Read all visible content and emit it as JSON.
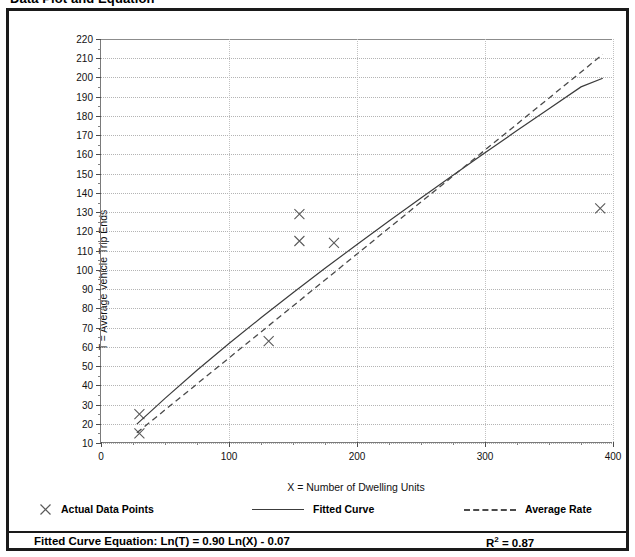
{
  "title": "Data Plot and Equation",
  "chart_data": {
    "type": "scatter",
    "title": "Data Plot and Equation",
    "xlabel": "X = Number of Dwelling Units",
    "ylabel": "T = Average Vehicle Trip Ends",
    "xlim": [
      0,
      400
    ],
    "ylim": [
      10,
      220
    ],
    "xticks": [
      0,
      100,
      200,
      300,
      400
    ],
    "xtick_labels": [
      "0",
      "100",
      "200",
      "300",
      "400"
    ],
    "x_minor_step": 25,
    "yticks": [
      10,
      20,
      30,
      40,
      50,
      60,
      70,
      80,
      90,
      100,
      110,
      120,
      130,
      140,
      150,
      160,
      170,
      180,
      190,
      200,
      210,
      220
    ],
    "ytick_labels": [
      "10",
      "20",
      "30",
      "40",
      "50",
      "60",
      "70",
      "80",
      "90",
      "100",
      "110",
      "120",
      "130",
      "140",
      "150",
      "160",
      "170",
      "180",
      "190",
      "200",
      "210",
      "220"
    ],
    "grid": true,
    "legend_position": "bottom",
    "series": [
      {
        "name": "Actual Data Points",
        "type": "scatter",
        "marker": "x",
        "color": "#5a5a5a",
        "points": [
          {
            "x": 30,
            "y": 25
          },
          {
            "x": 30,
            "y": 15
          },
          {
            "x": 131,
            "y": 63
          },
          {
            "x": 155,
            "y": 129
          },
          {
            "x": 155,
            "y": 115
          },
          {
            "x": 182,
            "y": 114
          },
          {
            "x": 390,
            "y": 132
          }
        ]
      },
      {
        "name": "Fitted Curve",
        "type": "line",
        "style": "solid",
        "color": "#3c3c3c",
        "equation": "Ln(T) = 0.90 Ln(X) - 0.07",
        "points": [
          {
            "x": 28,
            "y": 19.8
          },
          {
            "x": 50,
            "y": 33.2
          },
          {
            "x": 75,
            "y": 47.8
          },
          {
            "x": 100,
            "y": 61.7
          },
          {
            "x": 125,
            "y": 75.1
          },
          {
            "x": 150,
            "y": 88.1
          },
          {
            "x": 175,
            "y": 100.8
          },
          {
            "x": 200,
            "y": 113.2
          },
          {
            "x": 225,
            "y": 125.4
          },
          {
            "x": 250,
            "y": 137.4
          },
          {
            "x": 275,
            "y": 149.2
          },
          {
            "x": 300,
            "y": 160.9
          },
          {
            "x": 325,
            "y": 172.4
          },
          {
            "x": 350,
            "y": 183.8
          },
          {
            "x": 375,
            "y": 195.1
          },
          {
            "x": 392,
            "y": 199.6
          }
        ]
      },
      {
        "name": "Average Rate",
        "type": "line",
        "style": "dashed",
        "color": "#4a4a4a",
        "points": [
          {
            "x": 28,
            "y": 15.3
          },
          {
            "x": 392,
            "y": 212.0
          }
        ]
      }
    ],
    "annotations": [
      {
        "label": "Fitted Curve Equation:  Ln(T) = 0.90 Ln(X) - 0.07"
      },
      {
        "label": "R2 = 0.87"
      }
    ]
  },
  "legend": {
    "points_label": "Actual Data Points",
    "fitted_label": "Fitted Curve",
    "average_label": "Average Rate",
    "marker_glyph": "✕"
  },
  "equation": {
    "prefix": "Fitted Curve Equation:",
    "formula": "Ln(T) = 0.90 Ln(X) - 0.07",
    "full": "Fitted Curve Equation:  Ln(T) = 0.90 Ln(X) - 0.07",
    "r2_base": "R",
    "r2_exp": "2",
    "r2_value": " = 0.87"
  },
  "colors": {
    "frame": "#1a1a1a",
    "grid": "#b4b4b4",
    "axis": "#7a7a7a",
    "fitted": "#3c3c3c",
    "average": "#4a4a4a",
    "marker": "#5a5a5a",
    "text": "#000000"
  }
}
